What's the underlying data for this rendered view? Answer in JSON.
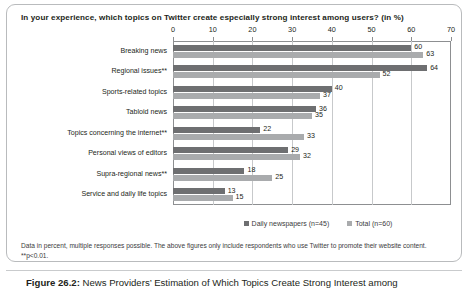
{
  "chart_data": {
    "type": "bar",
    "orientation": "horizontal",
    "title": "In your experience, which topics on Twitter create especially strong interest among users? (in %)",
    "xlabel": "",
    "ylabel": "",
    "xlim": [
      0,
      70
    ],
    "xticks": [
      0,
      10,
      20,
      30,
      40,
      50,
      60,
      70
    ],
    "grid": true,
    "legend_position": "bottom",
    "categories": [
      "Breaking news",
      "Regional issues**",
      "Sports-related topics",
      "Tabloid news",
      "Topics concerning the internet**",
      "Personal views of editors",
      "Supra-regional news**",
      "Service and daily life topics"
    ],
    "series": [
      {
        "name": "Daily newspapers (n=45)",
        "color": "#6e6f71",
        "values": [
          60,
          64,
          40,
          36,
          22,
          29,
          18,
          13
        ]
      },
      {
        "name": "Total (n=60)",
        "color": "#a9abad",
        "values": [
          63,
          52,
          37,
          35,
          33,
          32,
          25,
          15
        ]
      }
    ]
  },
  "footnote": "Data in percent, multiple responses possible. The above figures only include respondents who use Twitter to promote their website content. **p<0.01.",
  "caption": {
    "label": "Figure 26.2:",
    "text": " News Providers’ Estimation of Which Topics Create Strong Interest among"
  }
}
